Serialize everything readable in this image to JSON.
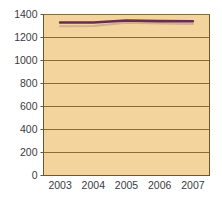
{
  "chart_data": {
    "type": "line",
    "title": "",
    "subtitle": "",
    "xlabel": "",
    "ylabel": "",
    "categories": [
      "2003",
      "2004",
      "2005",
      "2006",
      "2007"
    ],
    "x": [
      2003,
      2004,
      2005,
      2006,
      2007
    ],
    "series": [
      {
        "name": "series-primary",
        "color": "#6b2a50",
        "values": [
          1330,
          1330,
          1348,
          1342,
          1341
        ]
      },
      {
        "name": "series-shadow",
        "color": "#c9a98e",
        "values": [
          1298,
          1300,
          1330,
          1322,
          1318
        ]
      }
    ],
    "ylim": [
      0,
      1400
    ],
    "yticks": [
      0,
      200,
      400,
      600,
      800,
      1000,
      1200,
      1400
    ],
    "ytick_labels": [
      "0",
      "200",
      "400",
      "600",
      "800",
      "1000",
      "1200",
      "1400"
    ],
    "xtick_labels": [
      "2003",
      "2004",
      "2005",
      "2006",
      "2007"
    ],
    "grid": true,
    "grid_axis": "y",
    "legend": false,
    "legend_position": "none",
    "annotations": [],
    "colors": {
      "plot_background": "#f2d49c",
      "page_background": "#ffffff",
      "gridline": "#8a6a36",
      "axis_line": "#6e5527",
      "tick_label": "#3a3a42",
      "line_primary": "#6b2a50",
      "line_shadow": "#c9a98e"
    }
  }
}
